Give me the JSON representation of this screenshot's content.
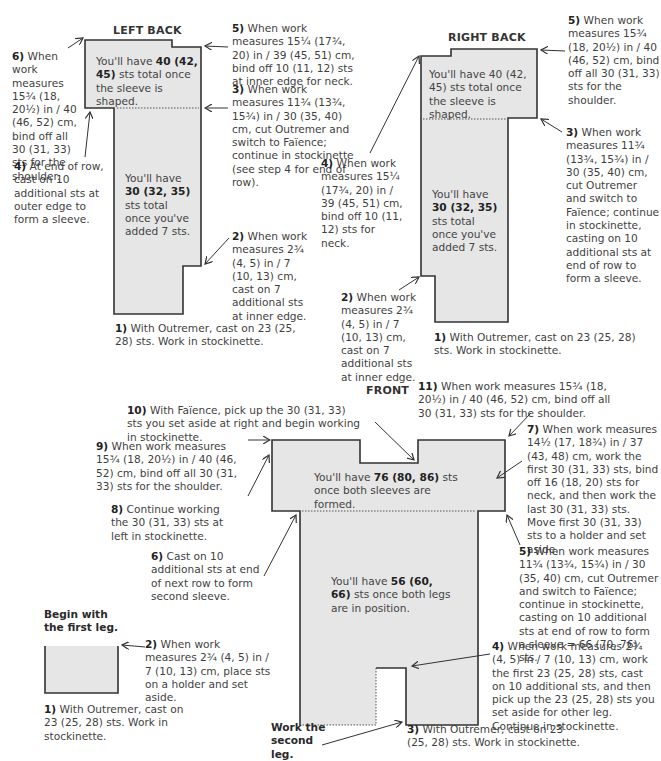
{
  "colors": {
    "fill": "#e6e6e6",
    "outline": "#333333",
    "text": "#3f3f3f",
    "bold": "#222222"
  },
  "left_back": {
    "title": "LEFT BACK",
    "inner_top": [
      "You'll have ",
      "40 (42, 45)",
      " sts total once the sleeve is shaped."
    ],
    "inner_bottom": [
      "You'll have ",
      "30 (32, 35)",
      " sts total once you've added 7 sts."
    ],
    "steps": {
      "s1": {
        "num": "1)",
        "text": "With Outremer, cast on 23 (25, 28) sts. Work in stockinette."
      },
      "s2": {
        "num": "2)",
        "text": "When work measures 2¾ (4, 5) in / 7 (10, 13) cm, cast on 7 additional sts at inner edge."
      },
      "s3": {
        "num": "3)",
        "text": "When work measures 11¾ (13¾, 15¾) in / 30 (35, 40) cm, cut Outremer and switch to Faïence; continue in stockinette (see step 4 for end of row)."
      },
      "s4": {
        "num": "4)",
        "text": "At end of row, cast on 10 additional sts at outer edge to form a sleeve."
      },
      "s5": {
        "num": "5)",
        "text": "When work measures 15¼ (17¾, 20) in / 39 (45, 51) cm, bind off 10 (11, 12) sts at inner edge for neck."
      },
      "s6": {
        "num": "6)",
        "text": "When work measures 15¾ (18, 20½) in / 40 (46, 52) cm, bind off all 30 (31, 33) sts for the shoulder."
      }
    }
  },
  "right_back": {
    "title": "RIGHT BACK",
    "inner_top": "You'll have 40 (42, 45) sts total once the sleeve is shaped.",
    "inner_bottom": [
      "You'll have ",
      "30 (32, 35)",
      " sts total once you've added 7 sts."
    ],
    "steps": {
      "s1": {
        "num": "1)",
        "text": "With Outremer, cast on 23 (25, 28) sts. Work in stockinette."
      },
      "s2": {
        "num": "2)",
        "text": "When work measures 2¾ (4, 5) in / 7 (10, 13) cm, cast on 7 additional sts at inner edge."
      },
      "s3": {
        "num": "3)",
        "text": "When work measures 11¾ (13¾, 15¾) in / 30 (35, 40) cm, cut Outremer and switch to Faïence; continue in stockinette, casting on 10 additional sts at end of row to form a sleeve."
      },
      "s4": {
        "num": "4)",
        "text": "When work measures 15¼ (17¾, 20) in / 39 (45, 51) cm, bind off 10 (11, 12) sts for neck."
      },
      "s5": {
        "num": "5)",
        "text": "When work measures 15¾ (18, 20½) in / 40 (46, 52) cm, bind off all 30 (31, 33) sts for the shoulder."
      }
    }
  },
  "front": {
    "title": "FRONT",
    "inner_top": [
      "You'll have ",
      "76 (80, 86)",
      " sts once both sleeves are formed."
    ],
    "inner_bottom": [
      "You'll have ",
      "56 (60, 66)",
      " sts once both legs are in position."
    ],
    "begin_label": "Begin with the first leg.",
    "second_leg_label": "Work the second leg.",
    "first_leg": {
      "s1": {
        "num": "1)",
        "text": "With Outremer, cast on 23 (25, 28) sts. Work in stockinette."
      },
      "s2": {
        "num": "2)",
        "text": "When work measures 2¾ (4, 5) in / 7 (10, 13) cm, place sts on a holder and set aside."
      }
    },
    "steps": {
      "s3": {
        "num": "3)",
        "text": "With Outremer, cast on 23 (25, 28) sts. Work in stockinette."
      },
      "s4": {
        "num": "4)",
        "text": "When work measures 2¾ (4, 5) in / 7 (10, 13) cm, work the first 23 (25, 28) sts, cast on 10 additional sts, and then pick up the 23 (25, 28) sts you set aside for other leg. Continue in stockinette."
      },
      "s5": {
        "num": "5)",
        "text": "When work measures 11¾ (13¾, 15¾) in / 30 (35, 40) cm, cut Outremer and switch to Faïence; continue in stockinette, casting on 10 additional sts at end of row to form a sleeve = 66 (70, 76) sts."
      },
      "s6": {
        "num": "6)",
        "text": "Cast on 10 additional sts at end of next row to form second sleeve."
      },
      "s7": {
        "num": "7)",
        "text": "When work measures 14½ (17, 18¾) in / 37 (43, 48) cm, work the first 30 (31, 33) sts, bind off 16 (18, 20) sts for neck, and then work the last 30 (31, 33) sts. Move first 30 (31, 33) sts to a holder and set aside."
      },
      "s8": {
        "num": "8)",
        "text": "Continue working the 30 (31, 33) sts at left in stockinette."
      },
      "s9": {
        "num": "9)",
        "text": "When work measures 15¾ (18, 20½) in / 40 (46, 52) cm, bind off all 30 (31, 33) sts for the shoulder."
      },
      "s10": {
        "num": "10)",
        "text": "With Faïence, pick up the 30 (31, 33) sts you set aside at right and begin working in stockinette."
      },
      "s11": {
        "num": "11)",
        "text": "When work measures 15¾ (18, 20½) in / 40 (46, 52) cm, bind off all 30 (31, 33) sts for the shoulder."
      }
    }
  }
}
